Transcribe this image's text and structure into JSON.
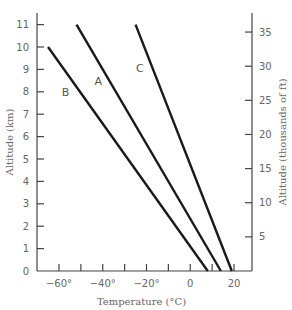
{
  "chart_data": {
    "type": "line",
    "title": "",
    "xlabel": "Temperature (°C)",
    "ylabel": "Altitude (km)",
    "ylabel_right": "Altitude (thousands of ft)",
    "xlim": [
      -70,
      25
    ],
    "ylim": [
      0,
      11.5
    ],
    "ylim_right": [
      0,
      37.7
    ],
    "x_ticks": [
      -60,
      -50,
      -40,
      -30,
      -20,
      -10,
      0,
      10,
      20
    ],
    "x_tick_labels": [
      {
        "value": -60,
        "label": "−60°"
      },
      {
        "value": -40,
        "label": "−40°"
      },
      {
        "value": -20,
        "label": "−20°"
      },
      {
        "value": 0,
        "label": "0"
      },
      {
        "value": 20,
        "label": "20"
      }
    ],
    "y_ticks": [
      0,
      1,
      2,
      3,
      4,
      5,
      6,
      7,
      8,
      9,
      10,
      11
    ],
    "y_right_ticks": [
      5,
      10,
      15,
      20,
      25,
      30,
      35
    ],
    "grid": false,
    "legend": "inline labels",
    "series": [
      {
        "name": "A",
        "points": [
          [
            -52,
            11
          ],
          [
            14,
            0
          ]
        ],
        "label_pos": [
          -42,
          8.3
        ]
      },
      {
        "name": "B",
        "points": [
          [
            -65,
            10
          ],
          [
            8,
            0
          ]
        ],
        "label_pos": [
          -57,
          7.8
        ]
      },
      {
        "name": "C",
        "points": [
          [
            -25,
            11
          ],
          [
            19,
            0
          ]
        ],
        "label_pos": [
          -23,
          8.9
        ]
      }
    ]
  }
}
